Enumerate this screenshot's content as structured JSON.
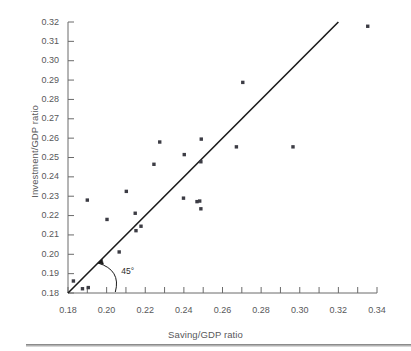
{
  "chart_data": {
    "type": "scatter",
    "title": "",
    "xlabel": "Saving/GDP ratio",
    "ylabel": "Investment/GDP ratio",
    "xlim": [
      0.18,
      0.34
    ],
    "ylim": [
      0.18,
      0.32
    ],
    "xticks": [
      0.18,
      0.2,
      0.22,
      0.24,
      0.26,
      0.28,
      0.3,
      0.32,
      0.34
    ],
    "xtick_labels": [
      "0.18",
      "0.20",
      "0.22",
      "0.24",
      "0.26",
      "0.28",
      "0.30",
      "0.32",
      "0.34"
    ],
    "xminor_step": 0.01,
    "yticks": [
      0.18,
      0.19,
      0.2,
      0.21,
      0.22,
      0.23,
      0.24,
      0.25,
      0.26,
      0.27,
      0.28,
      0.29,
      0.3,
      0.31,
      0.32
    ],
    "ytick_labels": [
      "0.18",
      "0.19",
      "0.20",
      "0.21",
      "0.22",
      "0.23",
      "0.24",
      "0.25",
      "0.26",
      "0.27",
      "0.28",
      "0.29",
      "0.30",
      "0.31",
      "0.32"
    ],
    "grid": false,
    "legend": false,
    "point_color": "#3c3c44",
    "line_color": "#1a1a1a",
    "axis_color": "#6a6a6a",
    "text_color": "#58585a",
    "reference_line": {
      "label": "45°",
      "slope": 1,
      "intercept": 0,
      "x_start": 0.18,
      "x_end": 0.32,
      "y_start": 0.18,
      "y_end": 0.32
    },
    "annotations": [
      {
        "text": "45°",
        "x": 0.2045,
        "y": 0.1915
      }
    ],
    "points": [
      {
        "x": 0.1828,
        "y": 0.1862
      },
      {
        "x": 0.1875,
        "y": 0.1822
      },
      {
        "x": 0.1905,
        "y": 0.1828
      },
      {
        "x": 0.19,
        "y": 0.228
      },
      {
        "x": 0.2002,
        "y": 0.218
      },
      {
        "x": 0.2065,
        "y": 0.2012
      },
      {
        "x": 0.2102,
        "y": 0.2325
      },
      {
        "x": 0.2148,
        "y": 0.2212
      },
      {
        "x": 0.2152,
        "y": 0.2122
      },
      {
        "x": 0.2178,
        "y": 0.2145
      },
      {
        "x": 0.2245,
        "y": 0.2465
      },
      {
        "x": 0.2275,
        "y": 0.258
      },
      {
        "x": 0.2398,
        "y": 0.229
      },
      {
        "x": 0.2402,
        "y": 0.2515
      },
      {
        "x": 0.2468,
        "y": 0.2272
      },
      {
        "x": 0.2482,
        "y": 0.2275
      },
      {
        "x": 0.2488,
        "y": 0.2235
      },
      {
        "x": 0.2488,
        "y": 0.2478
      },
      {
        "x": 0.249,
        "y": 0.2595
      },
      {
        "x": 0.2672,
        "y": 0.2555
      },
      {
        "x": 0.2705,
        "y": 0.2888
      },
      {
        "x": 0.2965,
        "y": 0.2555
      },
      {
        "x": 0.3352,
        "y": 0.3178
      }
    ]
  }
}
